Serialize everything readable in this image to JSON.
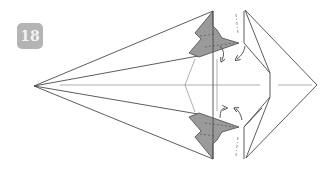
{
  "diagram": {
    "type": "origami-instruction-step",
    "step_number": "18",
    "colors": {
      "badge_bg": "#b4b4b4",
      "badge_text": "#f2f2f2",
      "paper_white": "#ffffff",
      "paper_colored": "#9a9a9a",
      "line": "#4a4a4a",
      "crease": "#8c8c8c"
    },
    "annotations": [
      {
        "kind": "fold-arrow",
        "position": "upper-left",
        "direction": "down"
      },
      {
        "kind": "fold-arrow",
        "position": "upper-right",
        "direction": "down"
      },
      {
        "kind": "fold-arrow",
        "position": "lower-left",
        "direction": "up"
      },
      {
        "kind": "fold-arrow",
        "position": "lower-right",
        "direction": "up"
      }
    ]
  }
}
